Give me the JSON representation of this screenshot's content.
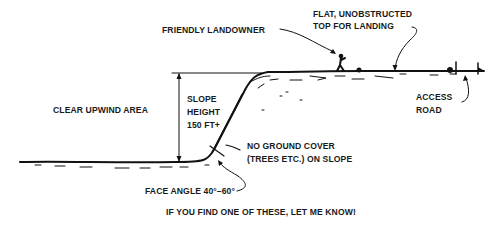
{
  "diagram": {
    "labels": {
      "friendly_landowner": "FRIENDLY LANDOWNER",
      "flat_top_line1": "FLAT, UNOBSTRUCTED",
      "flat_top_line2": "TOP FOR LANDING",
      "clear_upwind_area": "CLEAR UPWIND AREA",
      "slope_line1": "SLOPE",
      "slope_line2": "HEIGHT",
      "slope_line3": "150 FT+",
      "no_ground_cover_line1": "NO GROUND COVER",
      "no_ground_cover_line2": "(TREES ETC.) ON SLOPE",
      "access_line1": "ACCESS",
      "access_line2": "ROAD",
      "face_angle": "FACE ANGLE 40°–60°",
      "caption": "IF YOU FIND ONE OF THESE, LET ME KNOW!"
    },
    "colors": {
      "ink": "#111111",
      "background": "#ffffff"
    }
  }
}
